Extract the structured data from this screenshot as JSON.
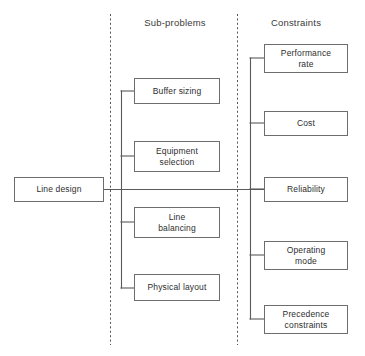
{
  "diagram": {
    "type": "tree-diagram",
    "colors": {
      "box_border": "#6d6d6d",
      "connector": "#5a5a5a",
      "divider": "#555555",
      "text": "#2e2e2e",
      "background": "#ffffff"
    },
    "columns": [
      {
        "id": "root",
        "header": ""
      },
      {
        "id": "sub-problems",
        "header": "Sub-problems"
      },
      {
        "id": "constraints",
        "header": "Constraints"
      }
    ],
    "root": {
      "label": "Line design"
    },
    "sub_problems": [
      {
        "label": "Buffer sizing"
      },
      {
        "label": "Equipment\nselection"
      },
      {
        "label": "Line\nbalancing"
      },
      {
        "label": "Physical layout"
      }
    ],
    "constraints": [
      {
        "label": "Performance\nrate"
      },
      {
        "label": "Cost"
      },
      {
        "label": "Reliability"
      },
      {
        "label": "Operating\nmode"
      },
      {
        "label": "Precedence\nconstraints"
      }
    ]
  }
}
